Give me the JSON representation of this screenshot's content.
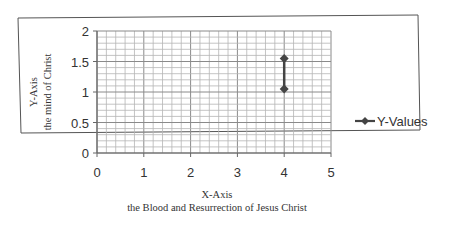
{
  "chart_data": {
    "type": "line",
    "title": "",
    "xlabel": "X-Axis",
    "xlabel_sub": "the Blood and Resurrection of Jesus Christ",
    "ylabel": "Y-Axis",
    "ylabel_sub": "the mind of Christ",
    "x_ticks": [
      "0",
      "1",
      "2",
      "3",
      "4",
      "5"
    ],
    "y_ticks": [
      "0",
      "0.5",
      "1",
      "1.5",
      "2"
    ],
    "xlim": [
      0,
      5
    ],
    "ylim": [
      0,
      2
    ],
    "grid": true,
    "legend_position": "right",
    "series": [
      {
        "name": "Y-Values",
        "marker": "diamond",
        "color": "#444444",
        "points": [
          {
            "x": 4,
            "y": 1.05
          },
          {
            "x": 4,
            "y": 1.55
          }
        ]
      }
    ]
  },
  "legend": {
    "label": "Y-Values"
  },
  "axes": {
    "x_title": "X-Axis",
    "x_subtitle": "the Blood and Resurrection of Jesus Christ",
    "y_title": "Y-Axis",
    "y_subtitle": "the mind of Christ"
  }
}
